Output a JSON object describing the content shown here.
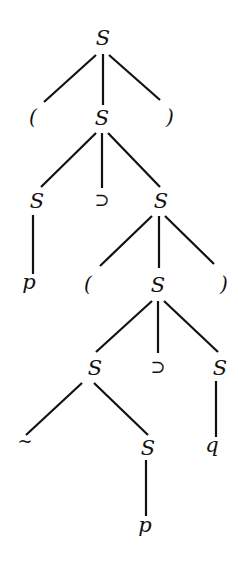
{
  "diagram": {
    "type": "parse-tree",
    "nodes": [
      {
        "id": "n0",
        "label": "S",
        "x": 103,
        "y": 45,
        "kind": "nonterminal"
      },
      {
        "id": "n1",
        "label": "(",
        "x": 33,
        "y": 124,
        "kind": "paren"
      },
      {
        "id": "n2",
        "label": "S",
        "x": 102,
        "y": 125,
        "kind": "nonterminal"
      },
      {
        "id": "n3",
        "label": ")",
        "x": 170,
        "y": 124,
        "kind": "paren"
      },
      {
        "id": "n4",
        "label": "S",
        "x": 37,
        "y": 208,
        "kind": "nonterminal"
      },
      {
        "id": "n5",
        "label": "⊃",
        "x": 102,
        "y": 206,
        "kind": "operator"
      },
      {
        "id": "n6",
        "label": "S",
        "x": 161,
        "y": 208,
        "kind": "nonterminal"
      },
      {
        "id": "n7",
        "label": "p",
        "x": 29,
        "y": 289,
        "kind": "terminal"
      },
      {
        "id": "n8",
        "label": "(",
        "x": 88,
        "y": 291,
        "kind": "paren"
      },
      {
        "id": "n9",
        "label": "S",
        "x": 158,
        "y": 292,
        "kind": "nonterminal"
      },
      {
        "id": "n10",
        "label": ")",
        "x": 224,
        "y": 291,
        "kind": "paren"
      },
      {
        "id": "n11",
        "label": "S",
        "x": 95,
        "y": 375,
        "kind": "nonterminal"
      },
      {
        "id": "n12",
        "label": "⊃",
        "x": 158,
        "y": 373,
        "kind": "operator"
      },
      {
        "id": "n13",
        "label": "S",
        "x": 220,
        "y": 375,
        "kind": "nonterminal"
      },
      {
        "id": "n14",
        "label": "~",
        "x": 25,
        "y": 447,
        "kind": "operator"
      },
      {
        "id": "n15",
        "label": "S",
        "x": 148,
        "y": 455,
        "kind": "nonterminal"
      },
      {
        "id": "n16",
        "label": "q",
        "x": 212,
        "y": 452,
        "kind": "terminal"
      },
      {
        "id": "n17",
        "label": "p",
        "x": 145,
        "y": 532,
        "kind": "terminal"
      }
    ],
    "edges": [
      {
        "from": "n0",
        "to": "n1",
        "x1": 96,
        "y1": 55,
        "x2": 44,
        "y2": 102
      },
      {
        "from": "n0",
        "to": "n2",
        "x1": 103,
        "y1": 54,
        "x2": 103,
        "y2": 105
      },
      {
        "from": "n0",
        "to": "n3",
        "x1": 109,
        "y1": 55,
        "x2": 160,
        "y2": 100
      },
      {
        "from": "n2",
        "to": "n4",
        "x1": 96,
        "y1": 133,
        "x2": 41,
        "y2": 187
      },
      {
        "from": "n2",
        "to": "n5",
        "x1": 102,
        "y1": 133,
        "x2": 102,
        "y2": 188
      },
      {
        "from": "n2",
        "to": "n6",
        "x1": 108,
        "y1": 133,
        "x2": 160,
        "y2": 187
      },
      {
        "from": "n4",
        "to": "n7",
        "x1": 33,
        "y1": 215,
        "x2": 33,
        "y2": 274
      },
      {
        "from": "n6",
        "to": "n8",
        "x1": 152,
        "y1": 216,
        "x2": 100,
        "y2": 266
      },
      {
        "from": "n6",
        "to": "n9",
        "x1": 159,
        "y1": 216,
        "x2": 159,
        "y2": 268
      },
      {
        "from": "n6",
        "to": "n10",
        "x1": 165,
        "y1": 216,
        "x2": 214,
        "y2": 264
      },
      {
        "from": "n9",
        "to": "n11",
        "x1": 152,
        "y1": 301,
        "x2": 96,
        "y2": 352
      },
      {
        "from": "n9",
        "to": "n12",
        "x1": 158,
        "y1": 301,
        "x2": 158,
        "y2": 353
      },
      {
        "from": "n9",
        "to": "n13",
        "x1": 164,
        "y1": 301,
        "x2": 218,
        "y2": 352
      },
      {
        "from": "n11",
        "to": "n14",
        "x1": 82,
        "y1": 383,
        "x2": 26,
        "y2": 435
      },
      {
        "from": "n11",
        "to": "n15",
        "x1": 94,
        "y1": 383,
        "x2": 148,
        "y2": 435
      },
      {
        "from": "n13",
        "to": "n16",
        "x1": 216,
        "y1": 381,
        "x2": 216,
        "y2": 437
      },
      {
        "from": "n15",
        "to": "n17",
        "x1": 146,
        "y1": 460,
        "x2": 146,
        "y2": 516
      }
    ],
    "colors": {
      "background": "#ffffff",
      "ink": "#111111"
    }
  }
}
